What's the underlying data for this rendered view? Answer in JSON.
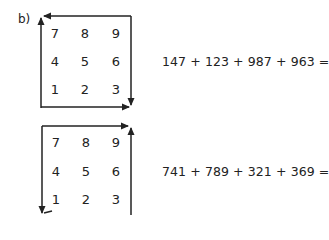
{
  "exercise": {
    "label": "b)",
    "problems": [
      {
        "grid": [
          [
            "7",
            "8",
            "9"
          ],
          [
            "4",
            "5",
            "6"
          ],
          [
            "1",
            "2",
            "3"
          ]
        ],
        "path": "counter-clockwise arrows: up left side, left along top, down right side, right along bottom",
        "equation": "147 + 123 + 987 + 963 ="
      },
      {
        "grid": [
          [
            "7",
            "8",
            "9"
          ],
          [
            "4",
            "5",
            "6"
          ],
          [
            "1",
            "2",
            "3"
          ]
        ],
        "path": "clockwise arrows: right along top, up right side, down left side",
        "equation": "741 + 789 + 321 + 369 ="
      }
    ]
  },
  "colors": {
    "ink": "#222222",
    "background": "#ffffff"
  }
}
